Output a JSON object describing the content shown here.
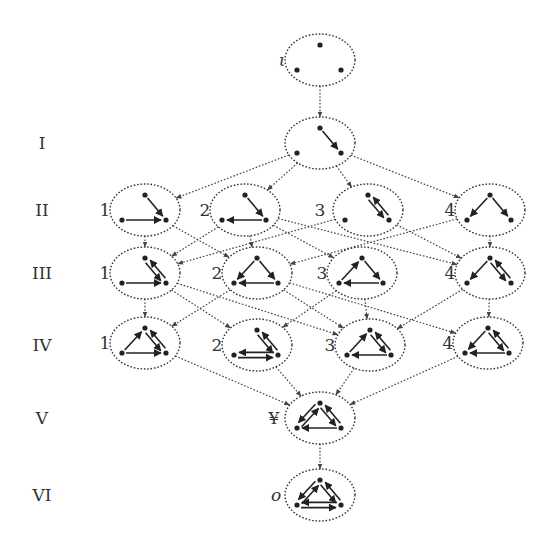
{
  "row_labels": [
    {
      "id": "I",
      "text": "I",
      "y": 143
    },
    {
      "id": "II",
      "text": "II",
      "y": 210
    },
    {
      "id": "III",
      "text": "III",
      "y": 273
    },
    {
      "id": "IV",
      "text": "IV",
      "y": 345
    },
    {
      "id": "V",
      "text": "V",
      "y": 418
    },
    {
      "id": "VI",
      "text": "VI",
      "y": 495
    }
  ],
  "nodes": [
    {
      "id": "iota",
      "label": "ι",
      "italic": true,
      "cx": 320,
      "cy": 60,
      "label_dx": -38,
      "arcs": []
    },
    {
      "id": "I",
      "label": "",
      "cx": 320,
      "cy": 143,
      "label_dx": 0,
      "arcs": [
        [
          "T",
          "R"
        ]
      ]
    },
    {
      "id": "II-1",
      "label": "1",
      "cx": 145,
      "cy": 210,
      "label_dx": -40,
      "arcs": [
        [
          "T",
          "R"
        ],
        [
          "L",
          "R"
        ]
      ]
    },
    {
      "id": "II-2",
      "label": "2",
      "cx": 245,
      "cy": 210,
      "label_dx": -40,
      "arcs": [
        [
          "T",
          "R"
        ],
        [
          "R",
          "L"
        ]
      ]
    },
    {
      "id": "II-3",
      "label": "3",
      "cx": 368,
      "cy": 210,
      "label_dx": -48,
      "arcs": [
        [
          "T",
          "R"
        ],
        [
          "R",
          "T"
        ]
      ]
    },
    {
      "id": "II-4",
      "label": "4",
      "cx": 490,
      "cy": 210,
      "label_dx": -40,
      "arcs": [
        [
          "T",
          "L"
        ],
        [
          "T",
          "R"
        ]
      ]
    },
    {
      "id": "III-1",
      "label": "1",
      "cx": 145,
      "cy": 273,
      "label_dx": -40,
      "arcs": [
        [
          "T",
          "R"
        ],
        [
          "R",
          "T"
        ],
        [
          "L",
          "R"
        ]
      ]
    },
    {
      "id": "III-2",
      "label": "2",
      "cx": 257,
      "cy": 273,
      "label_dx": -40,
      "arcs": [
        [
          "T",
          "L"
        ],
        [
          "T",
          "R"
        ],
        [
          "R",
          "L"
        ]
      ]
    },
    {
      "id": "III-3",
      "label": "3",
      "cx": 362,
      "cy": 273,
      "label_dx": -40,
      "arcs": [
        [
          "L",
          "T"
        ],
        [
          "T",
          "R"
        ],
        [
          "R",
          "L"
        ]
      ]
    },
    {
      "id": "III-4",
      "label": "4",
      "cx": 490,
      "cy": 273,
      "label_dx": -40,
      "arcs": [
        [
          "T",
          "L"
        ],
        [
          "T",
          "R"
        ],
        [
          "R",
          "T"
        ]
      ]
    },
    {
      "id": "IV-1",
      "label": "1",
      "cx": 145,
      "cy": 343,
      "label_dx": -40,
      "arcs": [
        [
          "L",
          "T"
        ],
        [
          "T",
          "R"
        ],
        [
          "R",
          "T"
        ],
        [
          "L",
          "R"
        ]
      ]
    },
    {
      "id": "IV-2",
      "label": "2",
      "cx": 257,
      "cy": 345,
      "label_dx": -40,
      "arcs": [
        [
          "T",
          "R"
        ],
        [
          "R",
          "T"
        ],
        [
          "L",
          "R"
        ],
        [
          "R",
          "L"
        ]
      ]
    },
    {
      "id": "IV-3",
      "label": "3",
      "cx": 370,
      "cy": 345,
      "label_dx": -40,
      "arcs": [
        [
          "L",
          "T"
        ],
        [
          "T",
          "R"
        ],
        [
          "R",
          "T"
        ],
        [
          "R",
          "L"
        ]
      ]
    },
    {
      "id": "IV-4",
      "label": "4",
      "cx": 488,
      "cy": 343,
      "label_dx": -40,
      "arcs": [
        [
          "T",
          "L"
        ],
        [
          "T",
          "R"
        ],
        [
          "R",
          "T"
        ],
        [
          "R",
          "L"
        ]
      ]
    },
    {
      "id": "V",
      "label": "¥",
      "italic": false,
      "cx": 320,
      "cy": 418,
      "label_dx": -46,
      "arcs": [
        [
          "L",
          "T"
        ],
        [
          "T",
          "L"
        ],
        [
          "T",
          "R"
        ],
        [
          "R",
          "T"
        ],
        [
          "R",
          "L"
        ]
      ]
    },
    {
      "id": "VI",
      "label": "o",
      "italic": true,
      "cx": 320,
      "cy": 495,
      "label_dx": -44,
      "arcs": [
        [
          "L",
          "T"
        ],
        [
          "T",
          "L"
        ],
        [
          "T",
          "R"
        ],
        [
          "R",
          "T"
        ],
        [
          "R",
          "L"
        ],
        [
          "L",
          "R"
        ]
      ]
    }
  ],
  "edges": [
    [
      "iota",
      "I"
    ],
    [
      "I",
      "II-1"
    ],
    [
      "I",
      "II-2"
    ],
    [
      "I",
      "II-3"
    ],
    [
      "I",
      "II-4"
    ],
    [
      "II-1",
      "III-1"
    ],
    [
      "II-1",
      "III-2"
    ],
    [
      "II-2",
      "III-1"
    ],
    [
      "II-2",
      "III-2"
    ],
    [
      "II-2",
      "III-3"
    ],
    [
      "II-2",
      "III-4"
    ],
    [
      "II-3",
      "III-1"
    ],
    [
      "II-3",
      "III-4"
    ],
    [
      "II-4",
      "III-2"
    ],
    [
      "II-4",
      "III-4"
    ],
    [
      "III-1",
      "IV-1"
    ],
    [
      "III-1",
      "IV-2"
    ],
    [
      "III-1",
      "IV-3"
    ],
    [
      "III-2",
      "IV-1"
    ],
    [
      "III-2",
      "IV-3"
    ],
    [
      "III-2",
      "IV-4"
    ],
    [
      "III-3",
      "IV-3"
    ],
    [
      "III-3",
      "IV-2"
    ],
    [
      "III-4",
      "IV-4"
    ],
    [
      "III-4",
      "IV-3"
    ],
    [
      "IV-1",
      "V"
    ],
    [
      "IV-2",
      "V"
    ],
    [
      "IV-3",
      "V"
    ],
    [
      "IV-4",
      "V"
    ],
    [
      "V",
      "VI"
    ]
  ],
  "style": {
    "ellipse_rx": 35,
    "ellipse_ry": 26,
    "ink": "#333333"
  }
}
